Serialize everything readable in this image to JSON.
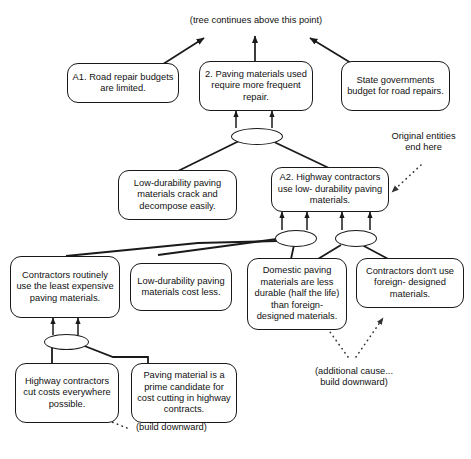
{
  "diagram": {
    "stroke_color": "#1a1a1a",
    "text_color": "#111111",
    "background": "#ffffff"
  },
  "notes": {
    "tree_continues": "(tree continues above this point)",
    "original_entities": "Original entities\nend here",
    "additional_cause": "(additional cause...\nbuild downward)",
    "build_downward": "(build downward)"
  },
  "nodes": [
    {
      "id": "a1_road_repair",
      "text": "A1. Road repair\nbudgets are limited."
    },
    {
      "id": "paving_materials_repair",
      "text": "2. Paving materials\nused require more\nfrequent repair."
    },
    {
      "id": "state_governments_budget",
      "text": "State governments\nbudget for road\nrepairs."
    },
    {
      "id": "low_durability_crack",
      "text": "Low-durability paving\nmaterials crack and\ndecompose easily."
    },
    {
      "id": "a2_highway_contractors",
      "text": "A2. Highway\ncontractors use low-\ndurability paving materials."
    },
    {
      "id": "contractors_least_expensive",
      "text": "Contractors routinely\nuse the least\nexpensive paving\nmaterials."
    },
    {
      "id": "low_durability_cost_less",
      "text": "Low-durability\npaving materials\ncost less."
    },
    {
      "id": "domestic_less_durable",
      "text": "Domestic paving\nmaterials are less\ndurable (half the\nlife) than foreign-\ndesigned materials."
    },
    {
      "id": "contractors_dont_use_foreign",
      "text": "Contractors don't\nuse foreign-\ndesigned materials."
    },
    {
      "id": "highway_contractors_cut_costs",
      "text": "Highway\ncontractors cut\ncosts everywhere\npossible."
    },
    {
      "id": "paving_material_prime_candidate",
      "text": "Paving material is\na prime candidate\nfor cost cutting\nin highway contracts."
    }
  ],
  "junctions": [
    {
      "id": "and-junction-top"
    },
    {
      "id": "and-junction-mid-left"
    },
    {
      "id": "and-junction-mid-right"
    },
    {
      "id": "and-junction-bottom"
    }
  ]
}
